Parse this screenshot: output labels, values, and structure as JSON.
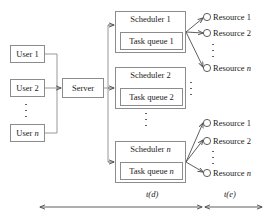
{
  "diagram": {
    "colors": {
      "stroke": "#8c8c8c",
      "arrow": "#4d4d4d",
      "text": "#1a1a1a",
      "background": "#ffffff"
    },
    "users": [
      {
        "label": "User 1"
      },
      {
        "label": "User 2"
      },
      {
        "label": "User n"
      }
    ],
    "users_ellipsis": "vertical-dots",
    "server": {
      "label": "Server"
    },
    "schedulers": [
      {
        "title": "Scheduler 1",
        "queue": "Task queue 1"
      },
      {
        "title": "Scheduler 2",
        "queue": "Task queue 2"
      },
      {
        "title": "Scheduler n",
        "queue": "Task queue n"
      }
    ],
    "schedulers_ellipsis": "vertical-dots",
    "resource_groups": [
      {
        "group": "top",
        "resources": [
          {
            "label": "Resource 1"
          },
          {
            "label": "Resource 2"
          },
          {
            "label": "Resource n"
          }
        ],
        "ellipsis": "vertical-dots"
      },
      {
        "group": "bottom",
        "resources": [
          {
            "label": "Resource 1"
          },
          {
            "label": "Resource 2"
          },
          {
            "label": "Resource n"
          }
        ],
        "ellipsis": "vertical-dots"
      }
    ],
    "timing_axis": [
      {
        "label": "t(d)",
        "span": "users-to-schedulers"
      },
      {
        "label": "t(e)",
        "span": "schedulers-to-resources"
      }
    ]
  }
}
